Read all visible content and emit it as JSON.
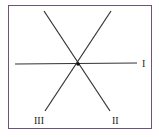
{
  "diagram": {
    "frame_color": "#6e5478",
    "line_color": "#333333",
    "center": [
      77,
      64
    ],
    "lines": [
      {
        "label": "I",
        "from": [
          15,
          64
        ],
        "to": [
          137,
          63
        ]
      },
      {
        "label": "II",
        "from": [
          44,
          11
        ],
        "to": [
          110,
          111
        ]
      },
      {
        "label": "III",
        "from": [
          111,
          11
        ],
        "to": [
          45,
          111
        ]
      }
    ],
    "labels": {
      "I": "I",
      "II": "II",
      "III": "III"
    }
  }
}
